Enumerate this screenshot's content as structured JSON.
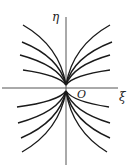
{
  "diagram": {
    "type": "phase-portrait",
    "axes": {
      "x_label": "ξ",
      "y_label": "η",
      "origin_label": "O"
    },
    "colors": {
      "curve": "#1a1a1a",
      "axis": "#555555",
      "background": "#ffffff"
    },
    "curves": {
      "upper_left_ends": [
        [
          23,
          25
        ],
        [
          22,
          42
        ],
        [
          20,
          55
        ],
        [
          23,
          70
        ]
      ],
      "upper_right_ends": [
        [
          110,
          25
        ],
        [
          112,
          42
        ],
        [
          110,
          55
        ],
        [
          110,
          70
        ]
      ],
      "lower_left_ends": [
        [
          17,
          107
        ],
        [
          18,
          123
        ],
        [
          21,
          138
        ],
        [
          22,
          152
        ]
      ],
      "lower_right_ends": [
        [
          109,
          107
        ],
        [
          110,
          123
        ],
        [
          110,
          138
        ],
        [
          107,
          152
        ]
      ]
    }
  }
}
